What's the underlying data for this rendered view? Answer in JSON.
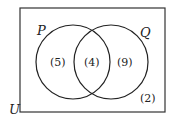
{
  "diagram": {
    "type": "venn",
    "universe_label": "U",
    "sets": [
      {
        "label": "P",
        "only_count": "(5)"
      },
      {
        "label": "Q",
        "only_count": "(9)"
      }
    ],
    "intersection_count": "(4)",
    "outside_count": "(2)"
  }
}
